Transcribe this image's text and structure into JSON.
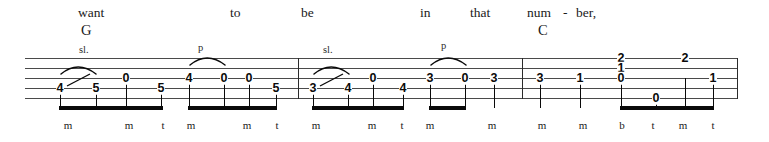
{
  "sheet": {
    "instrument": "banjo-tablature",
    "staff": {
      "lines": 5,
      "top": 58,
      "spacing": 10,
      "left": 25,
      "right": 738
    },
    "ink_color": "#0a0a0a",
    "staff_color": "#4a4a4a"
  },
  "lyrics": [
    {
      "text": "want",
      "x": 78,
      "y": 6
    },
    {
      "text": "to",
      "x": 230,
      "y": 6
    },
    {
      "text": "be",
      "x": 301,
      "y": 6
    },
    {
      "text": "in",
      "x": 420,
      "y": 6
    },
    {
      "text": "that",
      "x": 470,
      "y": 6
    },
    {
      "text": "num",
      "x": 527,
      "y": 6
    },
    {
      "text": "-",
      "x": 563,
      "y": 6
    },
    {
      "text": "ber,",
      "x": 576,
      "y": 6
    }
  ],
  "chord_symbols": [
    {
      "text": "G",
      "x": 81,
      "y": 23
    },
    {
      "text": "C",
      "x": 538,
      "y": 23
    }
  ],
  "technique_marks": [
    {
      "text": "sl.",
      "x": 79,
      "y": 45
    },
    {
      "text": "p",
      "x": 198,
      "y": 43
    },
    {
      "text": "sl.",
      "x": 323,
      "y": 45
    },
    {
      "text": "p",
      "x": 441,
      "y": 41
    }
  ],
  "barlines": [
    {
      "x": 298
    },
    {
      "x": 522
    },
    {
      "x": 737
    }
  ],
  "notes": [
    {
      "fret": "4",
      "x": 60,
      "string": 4,
      "measure": 1
    },
    {
      "fret": "5",
      "x": 96,
      "string": 4,
      "measure": 1
    },
    {
      "fret": "0",
      "x": 126,
      "string": 3,
      "measure": 1
    },
    {
      "fret": "5",
      "x": 161,
      "string": 4,
      "measure": 1
    },
    {
      "fret": "4",
      "x": 189,
      "string": 3,
      "measure": 1
    },
    {
      "fret": "0",
      "x": 224,
      "string": 3,
      "measure": 1
    },
    {
      "fret": "0",
      "x": 249,
      "string": 3,
      "measure": 1
    },
    {
      "fret": "5",
      "x": 276,
      "string": 4,
      "measure": 1
    },
    {
      "fret": "3",
      "x": 313,
      "string": 4,
      "measure": 2
    },
    {
      "fret": "4",
      "x": 348,
      "string": 4,
      "measure": 2
    },
    {
      "fret": "0",
      "x": 373,
      "string": 3,
      "measure": 2
    },
    {
      "fret": "4",
      "x": 403,
      "string": 4,
      "measure": 2
    },
    {
      "fret": "3",
      "x": 430,
      "string": 3,
      "measure": 2
    },
    {
      "fret": "0",
      "x": 465,
      "string": 3,
      "measure": 2
    },
    {
      "fret": "3",
      "x": 494,
      "string": 3,
      "measure": 2
    },
    {
      "fret": "3",
      "x": 540,
      "string": 3,
      "measure": 3
    },
    {
      "fret": "1",
      "x": 580,
      "string": 3,
      "measure": 3
    },
    {
      "fret": "2",
      "x": 621,
      "string": 1,
      "measure": 3
    },
    {
      "fret": "1",
      "x": 621,
      "string": 2,
      "measure": 3
    },
    {
      "fret": "0",
      "x": 621,
      "string": 3,
      "measure": 3
    },
    {
      "fret": "0",
      "x": 656,
      "string": 5,
      "measure": 3
    },
    {
      "fret": "2",
      "x": 685,
      "string": 1,
      "measure": 3
    },
    {
      "fret": "1",
      "x": 713,
      "string": 3,
      "measure": 3
    }
  ],
  "stems": [
    {
      "x": 60,
      "top": 88,
      "height": 20
    },
    {
      "x": 96,
      "top": 88,
      "height": 20
    },
    {
      "x": 126,
      "top": 78,
      "height": 30
    },
    {
      "x": 161,
      "top": 88,
      "height": 20
    },
    {
      "x": 189,
      "top": 78,
      "height": 30
    },
    {
      "x": 224,
      "top": 78,
      "height": 30
    },
    {
      "x": 249,
      "top": 78,
      "height": 30
    },
    {
      "x": 276,
      "top": 88,
      "height": 20
    },
    {
      "x": 313,
      "top": 88,
      "height": 20
    },
    {
      "x": 348,
      "top": 88,
      "height": 20
    },
    {
      "x": 373,
      "top": 78,
      "height": 30
    },
    {
      "x": 403,
      "top": 88,
      "height": 20
    },
    {
      "x": 430,
      "top": 78,
      "height": 30
    },
    {
      "x": 465,
      "top": 78,
      "height": 30
    },
    {
      "x": 494,
      "top": 78,
      "height": 30
    },
    {
      "x": 540,
      "top": 78,
      "height": 30
    },
    {
      "x": 580,
      "top": 78,
      "height": 30
    },
    {
      "x": 621,
      "top": 78,
      "height": 30
    },
    {
      "x": 656,
      "top": 98,
      "height": 10
    },
    {
      "x": 685,
      "top": 78,
      "height": 30
    },
    {
      "x": 713,
      "top": 78,
      "height": 30
    }
  ],
  "beams": [
    {
      "x": 59,
      "width": 104
    },
    {
      "x": 188,
      "width": 89
    },
    {
      "x": 312,
      "width": 92
    },
    {
      "x": 429,
      "width": 37
    },
    {
      "x": 620,
      "width": 94
    }
  ],
  "slurs": [
    {
      "x": 60,
      "y": 62,
      "width": 36,
      "height": 12,
      "type": "slide"
    },
    {
      "x": 189,
      "y": 53,
      "width": 36,
      "height": 12,
      "type": "pull-off"
    },
    {
      "x": 313,
      "y": 62,
      "width": 36,
      "height": 12,
      "type": "slide"
    },
    {
      "x": 430,
      "y": 53,
      "width": 36,
      "height": 12,
      "type": "pull-off"
    }
  ],
  "slide_lines": [
    {
      "x1": 67,
      "y1": 86,
      "x2": 90,
      "y2": 74
    },
    {
      "x1": 320,
      "y1": 86,
      "x2": 343,
      "y2": 74
    }
  ],
  "fingering": [
    {
      "text": "m",
      "x": 68,
      "y": 120
    },
    {
      "text": "m",
      "x": 129,
      "y": 120
    },
    {
      "text": "t",
      "x": 163,
      "y": 120
    },
    {
      "text": "m",
      "x": 191,
      "y": 120
    },
    {
      "text": "m",
      "x": 247,
      "y": 120
    },
    {
      "text": "t",
      "x": 277,
      "y": 120
    },
    {
      "text": "m",
      "x": 316,
      "y": 120
    },
    {
      "text": "m",
      "x": 372,
      "y": 120
    },
    {
      "text": "t",
      "x": 402,
      "y": 120
    },
    {
      "text": "m",
      "x": 430,
      "y": 120
    },
    {
      "text": "m",
      "x": 492,
      "y": 120
    },
    {
      "text": "m",
      "x": 542,
      "y": 120
    },
    {
      "text": "m",
      "x": 583,
      "y": 120
    },
    {
      "text": "b",
      "x": 622,
      "y": 120
    },
    {
      "text": "t",
      "x": 653,
      "y": 120
    },
    {
      "text": "m",
      "x": 683,
      "y": 120
    },
    {
      "text": "t",
      "x": 713,
      "y": 120
    }
  ]
}
